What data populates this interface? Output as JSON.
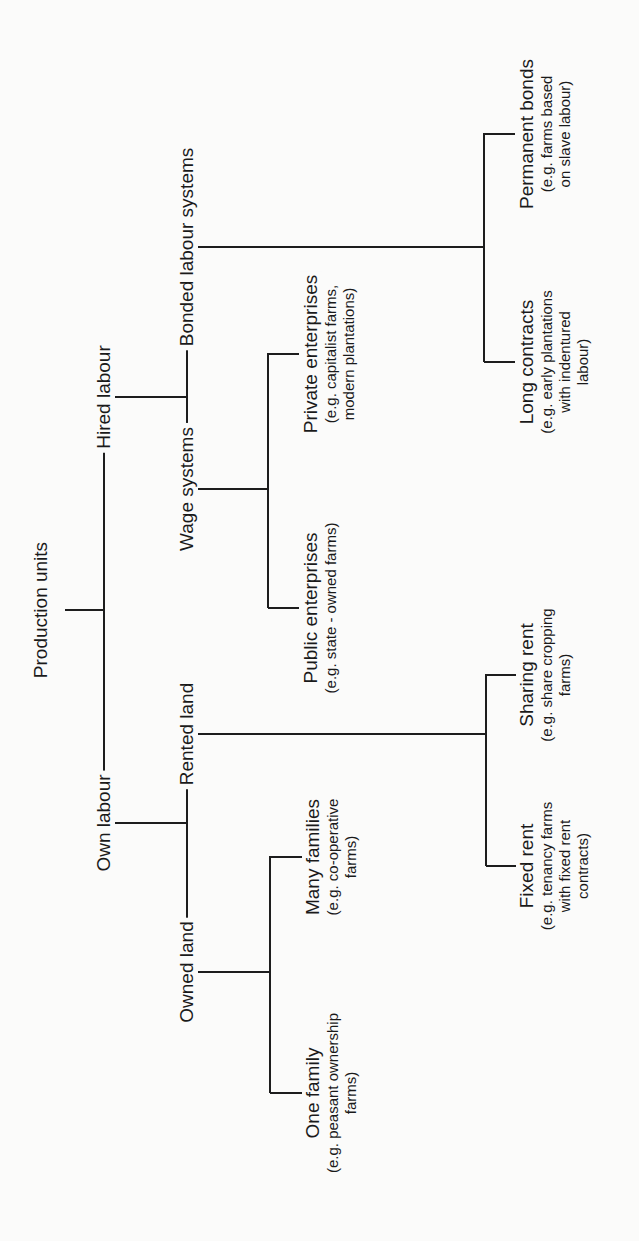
{
  "diagram": {
    "type": "tree",
    "orientation": "rotated-90-ccw",
    "line_color": "#1d1d1d",
    "background": "#fbfbfa",
    "root": {
      "label": "Production units"
    },
    "level1": {
      "own_labour": {
        "label": "Own labour"
      },
      "hired_labour": {
        "label": "Hired labour"
      }
    },
    "level2": {
      "owned_land": {
        "label": "Owned land"
      },
      "rented_land": {
        "label": "Rented land"
      },
      "wage_systems": {
        "label": "Wage systems"
      },
      "bonded_labour_systems": {
        "label": "Bonded labour systems"
      }
    },
    "leaves": {
      "one_family": {
        "label": "One family",
        "example": [
          "(e.g.  peasant ownership",
          "farms)"
        ]
      },
      "many_families": {
        "label": "Many families",
        "example": [
          "(e.g.   co-operative",
          "farms)"
        ]
      },
      "fixed_rent": {
        "label": "Fixed rent",
        "example": [
          "(e.g.  tenancy farms",
          "with fixed rent",
          "contracts)"
        ]
      },
      "sharing_rent": {
        "label": "Sharing rent",
        "example": [
          "(e.g.  share cropping",
          "farms)"
        ]
      },
      "public_enterprises": {
        "label": "Public enterprises",
        "example": [
          "(e.g.  state - owned farms)"
        ]
      },
      "private_enterprises": {
        "label": "Private enterprises",
        "example": [
          "(e.g.  capitalist farms,",
          "modern plantations)"
        ]
      },
      "long_contracts": {
        "label": "Long contracts",
        "example": [
          "(e.g.  early plantations",
          "with indentured",
          "labour)"
        ]
      },
      "permanent_bonds": {
        "label": "Permanent bonds",
        "example": [
          "(e.g.  farms based",
          "on slave labour)"
        ]
      }
    }
  }
}
